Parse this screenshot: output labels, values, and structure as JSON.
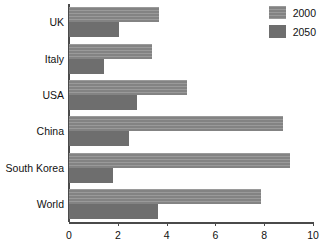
{
  "chart_data": {
    "type": "bar",
    "orientation": "horizontal",
    "title": "",
    "xlabel": "",
    "ylabel": "",
    "categories": [
      "UK",
      "Italy",
      "USA",
      "China",
      "South Korea",
      "World"
    ],
    "series": [
      {
        "name": "2000",
        "color": "#8b8b8b",
        "values": [
          3.7,
          3.4,
          4.85,
          8.75,
          9.05,
          7.85
        ]
      },
      {
        "name": "2050",
        "color": "#6e6e6e",
        "values": [
          2.05,
          1.45,
          2.8,
          2.45,
          1.8,
          3.65
        ]
      }
    ],
    "xlim": [
      0,
      10
    ],
    "xticks": [
      0,
      2,
      4,
      6,
      8,
      10
    ],
    "xtick_labels": [
      "0",
      "2",
      "4",
      "6",
      "8",
      "10"
    ],
    "grid": false,
    "legend_position": "top-right"
  },
  "legend": {
    "entries": [
      {
        "label": "2000"
      },
      {
        "label": "2050"
      }
    ]
  }
}
